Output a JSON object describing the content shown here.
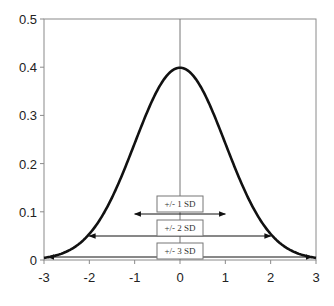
{
  "chart_data": {
    "type": "line",
    "title": "",
    "xlabel": "",
    "ylabel": "",
    "xlim": [
      -3,
      3
    ],
    "ylim": [
      0,
      0.5
    ],
    "x_ticks": [
      "-3",
      "-2",
      "-1",
      "0",
      "1",
      "2",
      "3"
    ],
    "y_ticks": [
      "0",
      "0.1",
      "0.2",
      "0.3",
      "0.4",
      "0.5"
    ],
    "grid": false,
    "legend": null,
    "series": [
      {
        "name": "Standard normal density",
        "x": [
          -3,
          -2.5,
          -2,
          -1.5,
          -1,
          -0.5,
          0,
          0.5,
          1,
          1.5,
          2,
          2.5,
          3
        ],
        "values": [
          0.004,
          0.018,
          0.054,
          0.13,
          0.242,
          0.352,
          0.399,
          0.352,
          0.242,
          0.13,
          0.054,
          0.018,
          0.004
        ]
      }
    ],
    "annotations": [
      {
        "label": "+/- 1 SD",
        "from": -1,
        "to": 1,
        "type": "double-arrow"
      },
      {
        "label": "+/- 2 SD",
        "from": -2,
        "to": 2,
        "type": "double-arrow"
      },
      {
        "label": "+/- 3 SD",
        "from": -3,
        "to": 3,
        "type": "double-arrow"
      }
    ],
    "reference_line": {
      "x": 0,
      "type": "vertical"
    }
  }
}
